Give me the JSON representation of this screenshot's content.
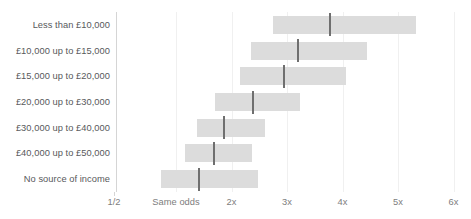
{
  "chart": {
    "title": "",
    "x_axis": {
      "label": "",
      "ticks": [
        {
          "label": "1/2",
          "value": 0.5
        },
        {
          "label": "Same odds",
          "value": 1
        },
        {
          "label": "2x",
          "value": 2
        },
        {
          "label": "3x",
          "value": 3
        },
        {
          "label": "4x",
          "value": 4
        },
        {
          "label": "5x",
          "value": 5
        },
        {
          "label": "6x",
          "value": 6
        }
      ]
    },
    "colors": {
      "box_fill": "#dcdcdc",
      "median_line": "#6f6f6f",
      "axis_line": "#d5d5d5",
      "gridline": "#f0f0f0",
      "category_text": "#58595b",
      "tick_text": "#7d7d7d"
    }
  },
  "chart_data": {
    "type": "bar",
    "subtype": "range-bar-with-median",
    "title": "",
    "xlabel": "",
    "ylabel": "",
    "xlim": [
      0.4,
      6.4
    ],
    "grid": true,
    "legend": null,
    "categories": [
      "Less than £10,000",
      "£10,000 up to £15,000",
      "£15,000 up to £20,000",
      "£20,000 up to £30,000",
      "£30,000 up to £40,000",
      "£40,000 up to £50,000",
      "No source of income"
    ],
    "tick_labels": [
      "1/2",
      "Same odds",
      "2x",
      "3x",
      "4x",
      "5x",
      "6x"
    ],
    "tick_values": [
      0.5,
      1,
      2,
      3,
      4,
      5,
      6
    ],
    "series": [
      {
        "name": "Lower bound",
        "values": [
          2.75,
          2.35,
          2.15,
          1.71,
          1.37,
          1.17,
          0.73
        ]
      },
      {
        "name": "Median",
        "values": [
          3.78,
          3.2,
          2.95,
          2.38,
          1.87,
          1.68,
          1.41
        ]
      },
      {
        "name": "Upper bound",
        "values": [
          5.33,
          4.44,
          4.06,
          3.24,
          2.61,
          2.37,
          2.48
        ]
      }
    ]
  }
}
